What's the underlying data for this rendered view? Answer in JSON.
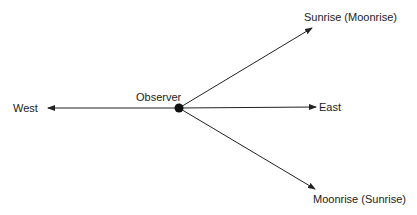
{
  "diagram": {
    "observer_label": "Observer",
    "west_label": "West",
    "east_label": "East",
    "sunrise_label": "Sunrise (Moonrise)",
    "moonrise_label": "Moonrise (Sunrise)",
    "line_color": "#222222"
  }
}
